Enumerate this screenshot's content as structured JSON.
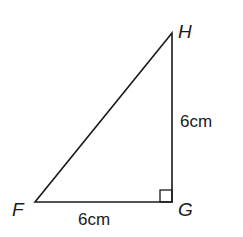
{
  "diagram": {
    "type": "right-triangle",
    "vertices": {
      "F": {
        "label": "F",
        "x": 35,
        "y": 202
      },
      "G": {
        "label": "G",
        "x": 172,
        "y": 202
      },
      "H": {
        "label": "H",
        "x": 172,
        "y": 33
      }
    },
    "right_angle_at": "G",
    "sides": {
      "FG": {
        "label": "6cm"
      },
      "GH": {
        "label": "6cm"
      }
    },
    "colors": {
      "stroke": "#1a1a1a",
      "background": "#ffffff"
    }
  }
}
